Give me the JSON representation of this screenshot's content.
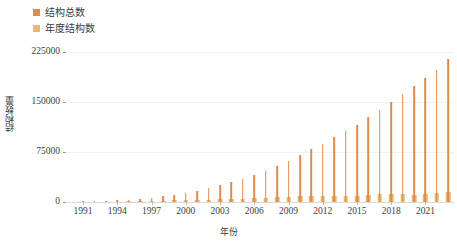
{
  "chart_data": {
    "type": "bar",
    "title": "",
    "xlabel": "年份",
    "ylabel": "结构数量",
    "ylim": [
      0,
      225000
    ],
    "yticks": [
      0,
      75000,
      150000,
      225000
    ],
    "ytick_labels": [
      "0",
      "75000",
      "150000",
      "225000"
    ],
    "grid": true,
    "legend_position": "top-left",
    "x": [
      1990,
      1991,
      1992,
      1993,
      1994,
      1995,
      1996,
      1997,
      1998,
      1999,
      2000,
      2001,
      2002,
      2003,
      2004,
      2005,
      2006,
      2007,
      2008,
      2009,
      2010,
      2011,
      2012,
      2013,
      2014,
      2015,
      2016,
      2017,
      2018,
      2019,
      2020,
      2021,
      2022,
      2023
    ],
    "xtick_labels": [
      "1991",
      "1994",
      "1997",
      "2000",
      "2003",
      "2006",
      "2009",
      "2012",
      "2015",
      "2018",
      "2021"
    ],
    "xtick_values": [
      1991,
      1994,
      1997,
      2000,
      2003,
      2006,
      2009,
      2012,
      2015,
      2018,
      2021
    ],
    "series": [
      {
        "name": "结构总数",
        "color": "#df8a4c",
        "values": [
          600,
          800,
          1100,
          1600,
          2300,
          3400,
          4800,
          6500,
          8400,
          10700,
          13600,
          17000,
          20600,
          24800,
          29400,
          34500,
          40000,
          46500,
          53700,
          61900,
          70600,
          78900,
          87600,
          96800,
          106500,
          116200,
          127100,
          138600,
          150700,
          162400,
          173600,
          185400,
          198600,
          213800
        ]
      },
      {
        "name": "年度结构数",
        "color": "#e9b96e",
        "values": [
          150,
          200,
          300,
          500,
          700,
          1100,
          1400,
          1700,
          1900,
          2300,
          2900,
          3400,
          3600,
          4200,
          4600,
          5100,
          5500,
          6500,
          7200,
          8200,
          8700,
          8300,
          8700,
          9200,
          9700,
          9700,
          10900,
          11500,
          12100,
          11700,
          11200,
          11800,
          13200,
          15200
        ]
      }
    ]
  },
  "legend": {
    "entries": [
      {
        "label": "结构总数",
        "color": "#df8a4c"
      },
      {
        "label": "年度结构数",
        "color": "#e9b96e"
      }
    ]
  },
  "axes": {
    "y_title": "结构数量",
    "x_title": "年份"
  }
}
